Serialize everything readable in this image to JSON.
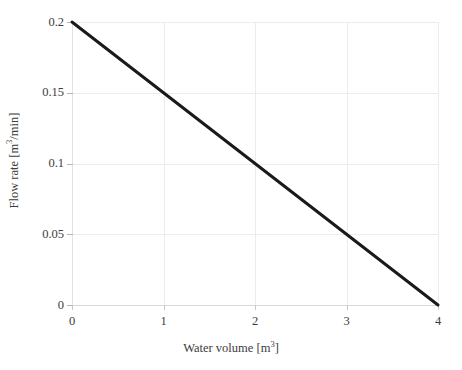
{
  "chart_data": {
    "type": "line",
    "title": "",
    "xlabel": "Water volume [m³]",
    "ylabel": "Flow rate [m³/min]",
    "xlim": [
      0,
      4
    ],
    "ylim": [
      0,
      0.2
    ],
    "grid": true,
    "legend": null,
    "xticks": [
      0,
      1,
      2,
      3,
      4
    ],
    "xtick_labels": [
      "0",
      "1",
      "2",
      "3",
      "4"
    ],
    "yticks": [
      0,
      0.05,
      0.1,
      0.15,
      0.2
    ],
    "ytick_labels": [
      "0",
      "0.05",
      "0.1",
      "0.15",
      "0.2"
    ],
    "series": [
      {
        "name": "flow rate vs water volume",
        "color": "#1a1a1a",
        "linewidth": 3,
        "x": [
          0,
          1,
          2,
          3,
          4
        ],
        "values": [
          0.2,
          0.15,
          0.1,
          0.05,
          0
        ]
      }
    ]
  },
  "axes": {
    "x_label_text": "Water volume [m",
    "x_label_unit_exp": "3",
    "x_label_tail": "]",
    "y_label_text": "Flow rate [m",
    "y_label_unit_exp": "3",
    "y_label_tail": "/min]"
  },
  "colors": {
    "background": "#ffffff",
    "line": "#1a1a1a",
    "grid": "#ececec",
    "axis": "#e2e2e2",
    "text": "#3c3c3c"
  }
}
